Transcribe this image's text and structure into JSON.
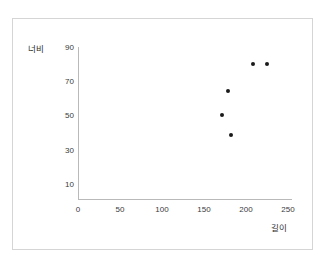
{
  "figure": {
    "background_color": "#ffffff",
    "frame_color": "#d5d5d5",
    "axis_color": "#b9b9b9",
    "marker_color": "#1a1a1a"
  },
  "chart_data": {
    "type": "scatter",
    "title": "",
    "xlabel": "길이",
    "ylabel": "너비",
    "xlim": [
      0,
      250
    ],
    "ylim": [
      0,
      90
    ],
    "grid": false,
    "legend": false,
    "xticks": [
      0,
      50,
      100,
      150,
      200,
      250
    ],
    "xtick_labels": [
      "0",
      "50",
      "100",
      "150",
      "200",
      "250"
    ],
    "yticks": [
      10,
      30,
      50,
      70,
      90
    ],
    "ytick_labels": [
      "10",
      "30",
      "50",
      "70",
      "90"
    ],
    "series": [
      {
        "name": "",
        "marker": "circle",
        "color": "#1a1a1a",
        "points": [
          {
            "x": 171,
            "y": 50
          },
          {
            "x": 178,
            "y": 64
          },
          {
            "x": 182,
            "y": 38
          },
          {
            "x": 208,
            "y": 80
          },
          {
            "x": 225,
            "y": 80
          }
        ]
      }
    ]
  }
}
